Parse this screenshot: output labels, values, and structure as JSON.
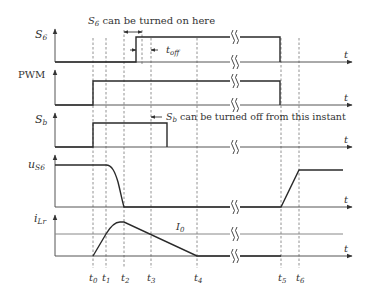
{
  "diagram": {
    "type": "timing-waveform",
    "colors": {
      "waveform": "#2a2a2a",
      "axis": "#555555",
      "dashed": "#777777",
      "text": "#333333",
      "reference": "#888888"
    },
    "time_markers": [
      {
        "id": "t0",
        "label": "t",
        "sub": "0",
        "x": 93
      },
      {
        "id": "t1",
        "label": "t",
        "sub": "1",
        "x": 106
      },
      {
        "id": "t2",
        "label": "t",
        "sub": "2",
        "x": 124
      },
      {
        "id": "t3",
        "label": "t",
        "sub": "3",
        "x": 151
      },
      {
        "id": "t4",
        "label": "t",
        "sub": "4",
        "x": 197
      },
      {
        "id": "t5",
        "label": "t",
        "sub": "5",
        "x": 281
      },
      {
        "id": "t6",
        "label": "t",
        "sub": "6",
        "x": 299
      }
    ],
    "extra_dashed_x": [
      124,
      136,
      140
    ],
    "time_axis_label": "t",
    "break_symbol": "≀≀",
    "traces": [
      {
        "id": "S6",
        "label": "S",
        "sub": "6",
        "axis_top": 29,
        "baseline": 62
      },
      {
        "id": "PWM",
        "label": "PWM",
        "sub": "",
        "axis_top": 70,
        "baseline": 105
      },
      {
        "id": "Sb",
        "label": "S",
        "sub": "b",
        "axis_top": 113,
        "baseline": 147
      },
      {
        "id": "uS6",
        "label": "u",
        "sub": "S6",
        "axis_top": 155,
        "baseline": 207
      },
      {
        "id": "iLr",
        "label": "i",
        "sub": "Lr",
        "axis_top": 215,
        "baseline": 256
      }
    ],
    "annotations": {
      "s6_turn_on": {
        "prefix": "S",
        "sub": "6",
        "text": " can be turned on here"
      },
      "t_off": {
        "prefix": "t",
        "sub": "off"
      },
      "sb_turn_off": {
        "prefix": "S",
        "sub": "b",
        "text": " can be turned off from this instant"
      },
      "i0": {
        "prefix": "I",
        "sub": "0"
      }
    }
  }
}
